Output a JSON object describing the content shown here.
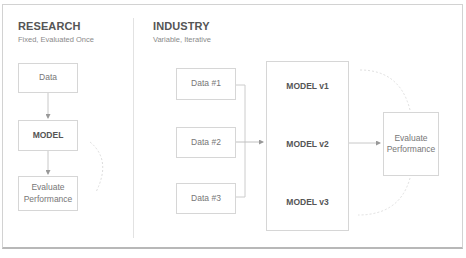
{
  "research": {
    "title": "RESEARCH",
    "subtitle": "Fixed, Evaluated Once",
    "nodes": {
      "data": "Data",
      "model": "MODEL",
      "evaluate": "Evaluate Performance"
    }
  },
  "industry": {
    "title": "INDUSTRY",
    "subtitle": "Variable, Iterative",
    "data_nodes": [
      "Data #1",
      "Data #2",
      "Data #3"
    ],
    "models": [
      "MODEL v1",
      "MODEL v2",
      "MODEL v3"
    ],
    "evaluate": "Evaluate Performance"
  },
  "colors": {
    "border": "#d6d6d6",
    "text": "#555555",
    "subtext": "#8a8a8a",
    "connector": "#bbbbbb"
  }
}
